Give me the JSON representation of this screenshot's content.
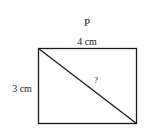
{
  "diagram": {
    "title": "P",
    "shape": "rectangle",
    "top_side_label": "4 cm",
    "left_side_label": "3 cm",
    "diagonal_label": "?",
    "colors": {
      "stroke": "#1a1a1a",
      "text": "#222222",
      "background": "#ffffff"
    }
  }
}
